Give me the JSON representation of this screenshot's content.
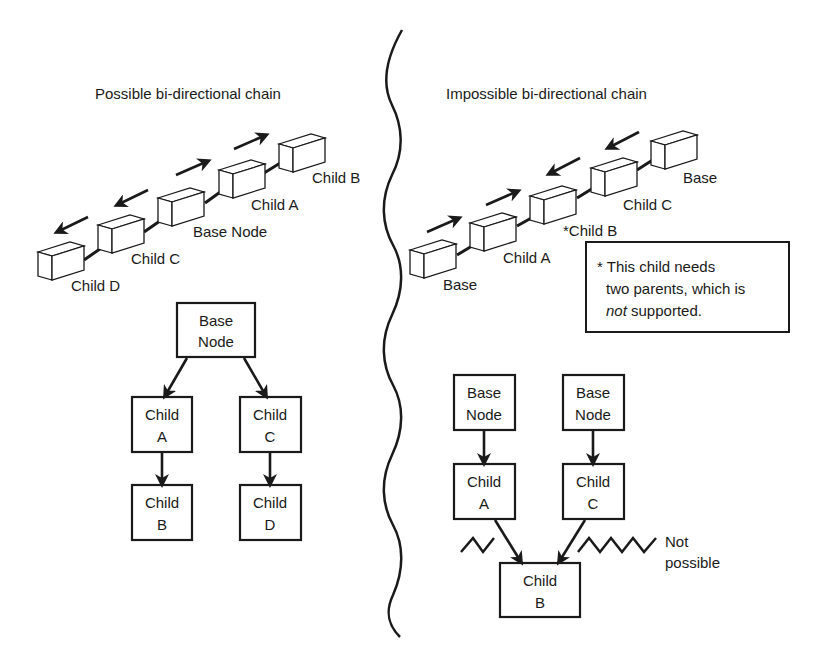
{
  "left_panel": {
    "title": "Possible bi-directional chain",
    "chain_labels": [
      "Child D",
      "Child C",
      "Base Node",
      "Child A",
      "Child B"
    ],
    "tree": {
      "root": [
        "Base",
        "Node"
      ],
      "child_a": [
        "Child",
        "A"
      ],
      "child_b": [
        "Child",
        "B"
      ],
      "child_c": [
        "Child",
        "C"
      ],
      "child_d": [
        "Child",
        "D"
      ]
    }
  },
  "right_panel": {
    "title": "Impossible bi-directional chain",
    "chain_labels": [
      "Base",
      "Child A",
      "*Child B",
      "Child C",
      "Base"
    ],
    "note": {
      "line1": "* This child needs",
      "line2": "two parents, which is",
      "line3_em": "not",
      "line3_rest": " supported."
    },
    "tree": {
      "root_left": [
        "Base",
        "Node"
      ],
      "root_right": [
        "Base",
        "Node"
      ],
      "child_a": [
        "Child",
        "A"
      ],
      "child_c": [
        "Child",
        "C"
      ],
      "child_b": [
        "Child",
        "B"
      ]
    },
    "not_possible": [
      "Not",
      "possible"
    ]
  }
}
